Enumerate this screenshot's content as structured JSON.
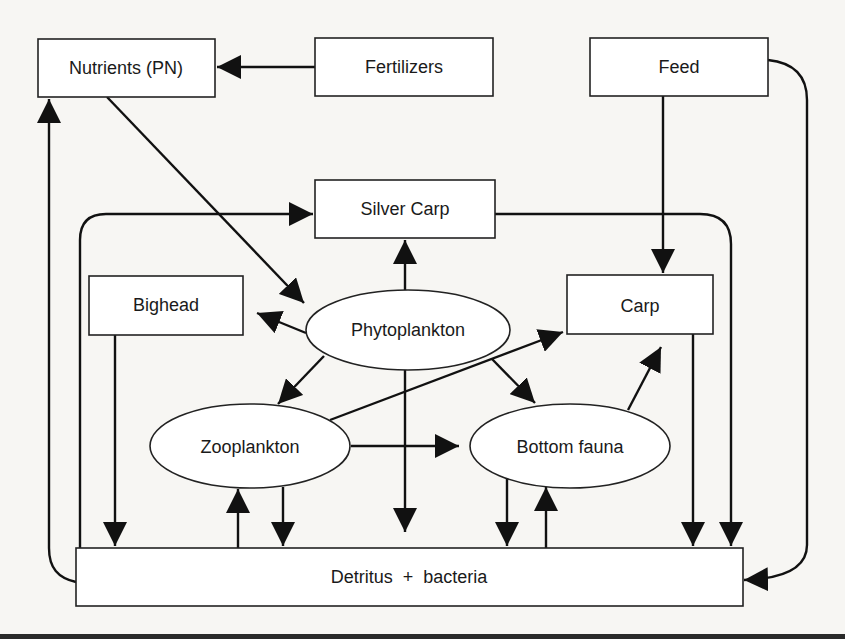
{
  "diagram": {
    "title": "",
    "nodes": {
      "nutrients": {
        "label": "Nutrients (PN)",
        "shape": "rect"
      },
      "fertilizers": {
        "label": "Fertilizers",
        "shape": "rect"
      },
      "feed": {
        "label": "Feed",
        "shape": "rect"
      },
      "silver_carp": {
        "label": "Silver Carp",
        "shape": "rect"
      },
      "bighead": {
        "label": "Bighead",
        "shape": "rect"
      },
      "carp": {
        "label": "Carp",
        "shape": "rect"
      },
      "phytoplankton": {
        "label": "Phytoplankton",
        "shape": "ellipse"
      },
      "zooplankton": {
        "label": "Zooplankton",
        "shape": "ellipse"
      },
      "bottom_fauna": {
        "label": "Bottom fauna",
        "shape": "ellipse"
      },
      "detritus": {
        "label": "Detritus  +  bacteria",
        "shape": "rect"
      }
    },
    "edges": [
      {
        "from": "Fertilizers",
        "to": "Nutrients (PN)"
      },
      {
        "from": "Nutrients (PN)",
        "to": "Phytoplankton"
      },
      {
        "from": "Detritus + bacteria",
        "to": "Nutrients (PN)"
      },
      {
        "from": "Feed",
        "to": "Carp"
      },
      {
        "from": "Feed",
        "to": "Detritus + bacteria"
      },
      {
        "from": "Detritus + bacteria",
        "to": "Silver Carp"
      },
      {
        "from": "Phytoplankton",
        "to": "Silver Carp"
      },
      {
        "from": "Silver Carp",
        "to": "Detritus + bacteria"
      },
      {
        "from": "Phytoplankton",
        "to": "Bighead"
      },
      {
        "from": "Bighead",
        "to": "Detritus + bacteria"
      },
      {
        "from": "Phytoplankton",
        "to": "Zooplankton"
      },
      {
        "from": "Phytoplankton",
        "to": "Bottom fauna"
      },
      {
        "from": "Phytoplankton",
        "to": "Detritus + bacteria"
      },
      {
        "from": "Zooplankton",
        "to": "Carp"
      },
      {
        "from": "Zooplankton",
        "to": "Bottom fauna"
      },
      {
        "from": "Zooplankton",
        "to": "Detritus + bacteria"
      },
      {
        "from": "Detritus + bacteria",
        "to": "Zooplankton"
      },
      {
        "from": "Bottom fauna",
        "to": "Carp"
      },
      {
        "from": "Bottom fauna",
        "to": "Detritus + bacteria"
      },
      {
        "from": "Detritus + bacteria",
        "to": "Bottom fauna"
      },
      {
        "from": "Carp",
        "to": "Detritus + bacteria"
      }
    ]
  }
}
